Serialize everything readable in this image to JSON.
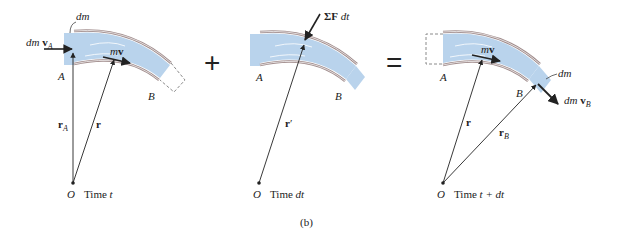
{
  "figure": {
    "caption": "(b)",
    "operators": {
      "plus": "+",
      "equals": "="
    },
    "colors": {
      "fluid": "#b9d3ec",
      "pipe_wall": "#a08c8c",
      "line": "#222222",
      "dashed": "#8a8a8a"
    },
    "panels": [
      {
        "id": "time-t",
        "labels": {
          "dm": "dm",
          "dm_vA_prefix": "dm ",
          "vA": "v",
          "vA_sub": "A",
          "mv_m": "m",
          "mv_v": "v",
          "A": "A",
          "B": "B",
          "rA": "r",
          "rA_sub": "A",
          "r": "r",
          "O": "O",
          "time": "Time ",
          "time_var": "t"
        }
      },
      {
        "id": "time-dt",
        "labels": {
          "force_sigma": "ΣF",
          "force_dt": " dt",
          "A": "A",
          "B": "B",
          "r_prime": "r",
          "prime": "′",
          "O": "O",
          "time": "Time ",
          "time_var": "dt"
        }
      },
      {
        "id": "time-t-plus-dt",
        "labels": {
          "mv_m": "m",
          "mv_v": "v",
          "dm": "dm",
          "dm_vB_prefix": "dm ",
          "vB": "v",
          "vB_sub": "B",
          "A": "A",
          "B": "B",
          "r": "r",
          "rB": "r",
          "rB_sub": "B",
          "O": "O",
          "time": "Time ",
          "time_var": "t + dt"
        }
      }
    ]
  }
}
